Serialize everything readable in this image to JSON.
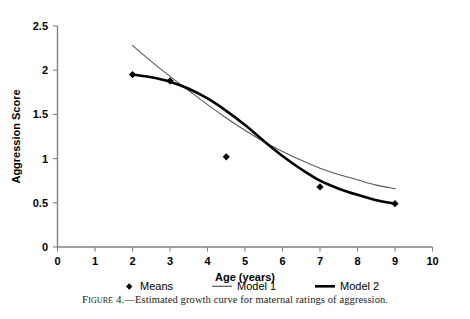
{
  "chart_data": {
    "type": "scatter",
    "title": "",
    "xlabel": "Age (years)",
    "ylabel": "Aggression Score",
    "xlim": [
      0,
      10
    ],
    "ylim": [
      0,
      2.5
    ],
    "xticks": [
      "0",
      "1",
      "2",
      "3",
      "4",
      "5",
      "6",
      "7",
      "8",
      "9",
      "10"
    ],
    "yticks": [
      "0",
      "0.5",
      "1",
      "1.5",
      "2",
      "2.5"
    ],
    "grid": false,
    "legend_position": "below-axis",
    "series": [
      {
        "name": "Means",
        "marker": "diamond",
        "color": "#000000",
        "x": [
          2,
          3,
          4.5,
          7,
          9
        ],
        "values": [
          1.95,
          1.88,
          1.02,
          0.68,
          0.49
        ]
      },
      {
        "name": "Model 1",
        "marker": "none",
        "color": "#595959",
        "linewidth": "thin",
        "x": [
          2,
          2.5,
          3,
          3.5,
          4,
          4.5,
          5,
          5.5,
          6,
          6.5,
          7,
          7.5,
          8,
          8.5,
          9
        ],
        "values": [
          2.28,
          2.1,
          1.93,
          1.77,
          1.61,
          1.46,
          1.32,
          1.19,
          1.08,
          0.98,
          0.89,
          0.82,
          0.76,
          0.7,
          0.66
        ]
      },
      {
        "name": "Model 2",
        "marker": "none",
        "color": "#000000",
        "linewidth": "thick",
        "x": [
          2,
          2.5,
          3,
          3.5,
          4,
          4.5,
          5,
          5.5,
          6,
          6.5,
          7,
          7.5,
          8,
          8.5,
          9
        ],
        "values": [
          1.95,
          1.92,
          1.87,
          1.79,
          1.68,
          1.54,
          1.38,
          1.2,
          1.03,
          0.88,
          0.75,
          0.66,
          0.59,
          0.53,
          0.49
        ]
      }
    ]
  },
  "legend": {
    "items": [
      {
        "label": "Means",
        "glyph": "diamond-marker"
      },
      {
        "label": "Model 1",
        "glyph": "thin-line"
      },
      {
        "label": "Model 2",
        "glyph": "thick-line"
      }
    ]
  },
  "caption": {
    "figure_word": "Figure 4.",
    "dash": "—",
    "text": "Estimated growth curve for maternal ratings of aggression."
  }
}
